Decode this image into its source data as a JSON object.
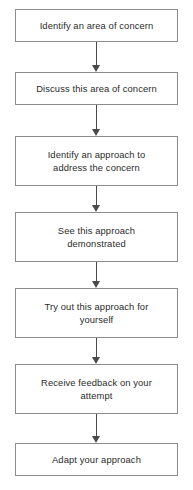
{
  "diagram": {
    "type": "flowchart",
    "orientation": "vertical",
    "title": "",
    "canvas": {
      "width": 193,
      "height": 490,
      "background": "#ffffff"
    },
    "style": {
      "box_fill": "#ffffff",
      "box_border": "#8d8d8d",
      "text_color": "#2b2b2b",
      "arrow_color": "#4a4a4a"
    },
    "nodes": [
      {
        "id": "node-1",
        "label": "Identify an area of concern",
        "lines": 1,
        "x": 15,
        "y": 9,
        "width": 163,
        "height": 33
      },
      {
        "id": "node-2",
        "label": "Discuss this area of concern",
        "lines": 1,
        "x": 15,
        "y": 72,
        "width": 163,
        "height": 33
      },
      {
        "id": "node-3",
        "label": "Identify an approach to\naddress the concern",
        "lines": 2,
        "x": 15,
        "y": 136,
        "width": 163,
        "height": 50
      },
      {
        "id": "node-4",
        "label": "See this approach\ndemonstrated",
        "lines": 2,
        "x": 15,
        "y": 212,
        "width": 163,
        "height": 50
      },
      {
        "id": "node-5",
        "label": "Try out this approach for\nyourself",
        "lines": 2,
        "x": 15,
        "y": 288,
        "width": 163,
        "height": 50
      },
      {
        "id": "node-6",
        "label": "Receive feedback on your\nattempt",
        "lines": 2,
        "x": 15,
        "y": 364,
        "width": 163,
        "height": 50
      },
      {
        "id": "node-7",
        "label": "Adapt your approach",
        "lines": 1,
        "x": 15,
        "y": 443,
        "width": 163,
        "height": 33
      }
    ],
    "edges": [
      {
        "id": "edge-1",
        "from": "node-1",
        "to": "node-2",
        "x": 96,
        "y": 42,
        "length": 30
      },
      {
        "id": "edge-2",
        "from": "node-2",
        "to": "node-3",
        "x": 96,
        "y": 105,
        "length": 31
      },
      {
        "id": "edge-3",
        "from": "node-3",
        "to": "node-4",
        "x": 96,
        "y": 186,
        "length": 26
      },
      {
        "id": "edge-4",
        "from": "node-4",
        "to": "node-5",
        "x": 96,
        "y": 262,
        "length": 26
      },
      {
        "id": "edge-5",
        "from": "node-5",
        "to": "node-6",
        "x": 96,
        "y": 338,
        "length": 26
      },
      {
        "id": "edge-6",
        "from": "node-6",
        "to": "node-7",
        "x": 96,
        "y": 414,
        "length": 29
      }
    ]
  }
}
